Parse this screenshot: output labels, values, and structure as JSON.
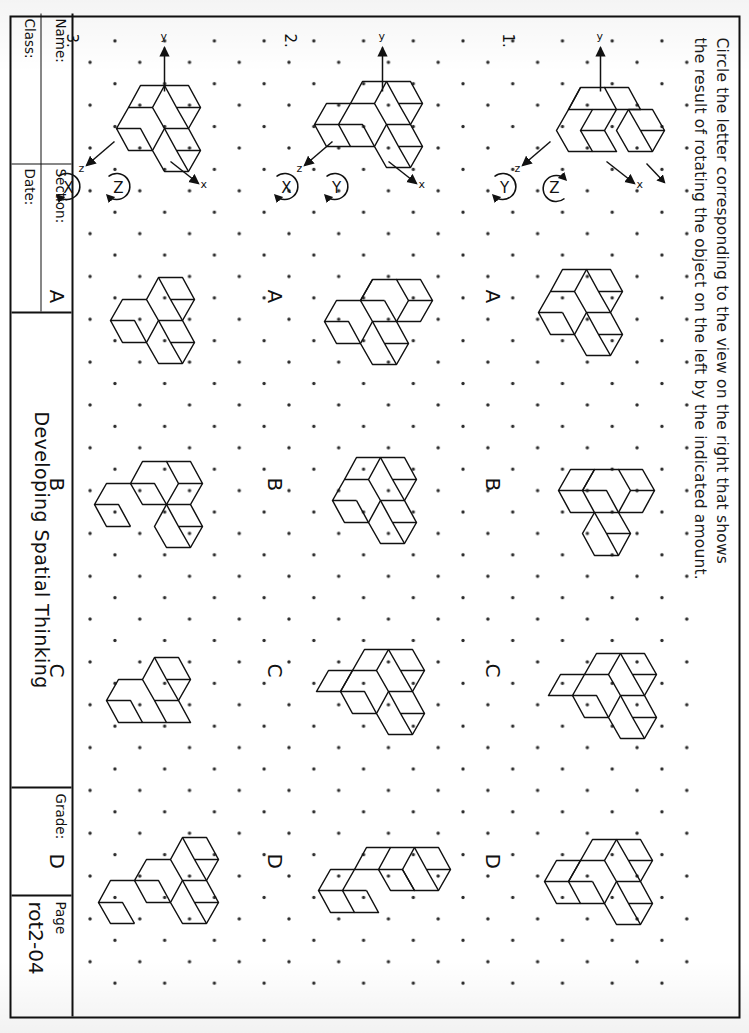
{
  "worksheet": {
    "instructions_line1": "Circle the letter corresponding to the view on the right that shows",
    "instructions_line2": "the result of rotating the object on the left by the indicated amount.",
    "answer_letters": [
      "A",
      "B",
      "C",
      "D"
    ]
  },
  "title_block": {
    "name_label": "Name:",
    "class_label": "Class:",
    "section_label": "Section:",
    "date_label": "Date:",
    "book_title": "Developing Spatial Thinking",
    "grade_label": "Grade:",
    "page_label": "Page",
    "page_number": "rot2-04"
  },
  "problems": [
    {
      "number": "1.",
      "axes": {
        "x_label": "x",
        "y_label": "y",
        "z_label": "z"
      },
      "rotations": [
        {
          "axis": "Z",
          "direction": "ccw"
        },
        {
          "axis": "Y",
          "direction": "cw"
        }
      ],
      "choices": [
        "A",
        "B",
        "C",
        "D"
      ]
    },
    {
      "number": "2.",
      "axes": {
        "x_label": "x",
        "y_label": "y",
        "z_label": "z"
      },
      "rotations": [
        {
          "axis": "Y",
          "direction": "cw"
        },
        {
          "axis": "X",
          "direction": "cw"
        }
      ],
      "choices": [
        "A",
        "B",
        "C",
        "D"
      ]
    },
    {
      "number": "3.",
      "axes": {
        "x_label": "x",
        "y_label": "y",
        "z_label": "z"
      },
      "rotations": [
        {
          "axis": "Z",
          "direction": "cw"
        },
        {
          "axis": "X",
          "direction": "cw"
        }
      ],
      "choices": [
        "A",
        "B",
        "C",
        "D"
      ]
    }
  ],
  "colors": {
    "ink": "#111111",
    "paper": "#ffffff",
    "dot": "#2b2b2b"
  }
}
